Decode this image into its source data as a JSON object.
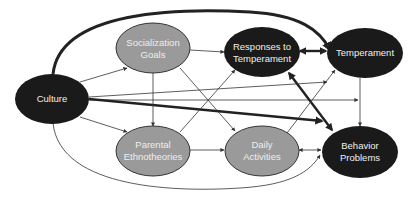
{
  "diagram": {
    "colors": {
      "dark_node": "#1a1a1a",
      "light_node": "#9a9a9a",
      "dark_text": "#f0f0f0",
      "light_text": "#e8e8e8",
      "edge": "#333333"
    },
    "nodes": [
      {
        "id": "culture",
        "lines": [
          "Culture"
        ],
        "style": "dark"
      },
      {
        "id": "socialization_goals",
        "lines": [
          "Socialization",
          "Goals"
        ],
        "style": "light"
      },
      {
        "id": "responses_to_temperament",
        "lines": [
          "Responses to",
          "Temperament"
        ],
        "style": "dark"
      },
      {
        "id": "temperament",
        "lines": [
          "Temperament"
        ],
        "style": "dark"
      },
      {
        "id": "parental_ethnotheories",
        "lines": [
          "Parental",
          "Ethnotheories"
        ],
        "style": "light"
      },
      {
        "id": "daily_activities",
        "lines": [
          "Daily",
          "Activities"
        ],
        "style": "light"
      },
      {
        "id": "behavior_problems",
        "lines": [
          "Behavior",
          "Problems"
        ],
        "style": "dark"
      }
    ],
    "edges": [
      {
        "from": "culture",
        "to": "temperament",
        "weight": "thick",
        "shape": "curve-top"
      },
      {
        "from": "culture",
        "to": "socialization_goals",
        "weight": "thin"
      },
      {
        "from": "culture",
        "to": "parental_ethnotheories",
        "weight": "thin"
      },
      {
        "from": "culture",
        "to": "behavior_problems",
        "weight": "thick"
      },
      {
        "from": "culture",
        "to": "temperament",
        "weight": "thin"
      },
      {
        "from": "culture",
        "to": "behavior_problems",
        "weight": "thin",
        "shape": "curve-bottom"
      },
      {
        "from": "socialization_goals",
        "to": "responses_to_temperament",
        "weight": "thin"
      },
      {
        "from": "socialization_goals",
        "to": "parental_ethnotheories",
        "weight": "thin"
      },
      {
        "from": "socialization_goals",
        "to": "daily_activities",
        "weight": "thin"
      },
      {
        "from": "parental_ethnotheories",
        "to": "responses_to_temperament",
        "weight": "thin"
      },
      {
        "from": "parental_ethnotheories",
        "to": "daily_activities",
        "weight": "thin"
      },
      {
        "from": "responses_to_temperament",
        "to": "temperament",
        "weight": "thick",
        "bidirectional": true
      },
      {
        "from": "responses_to_temperament",
        "to": "behavior_problems",
        "weight": "thick",
        "bidirectional": true
      },
      {
        "from": "daily_activities",
        "to": "temperament",
        "weight": "thin"
      },
      {
        "from": "temperament",
        "to": "behavior_problems",
        "weight": "thin"
      },
      {
        "from": "daily_activities",
        "to": "behavior_problems",
        "weight": "thin",
        "bidirectional": true
      },
      {
        "from": "behavior_problems",
        "to": "daily_activities",
        "weight": "thin"
      }
    ]
  },
  "labels": {
    "culture": "Culture",
    "socialization_goals_1": "Socialization",
    "socialization_goals_2": "Goals",
    "responses_1": "Responses to",
    "responses_2": "Temperament",
    "temperament": "Temperament",
    "parental_1": "Parental",
    "parental_2": "Ethnotheories",
    "daily_1": "Daily",
    "daily_2": "Activities",
    "behavior_1": "Behavior",
    "behavior_2": "Problems"
  }
}
